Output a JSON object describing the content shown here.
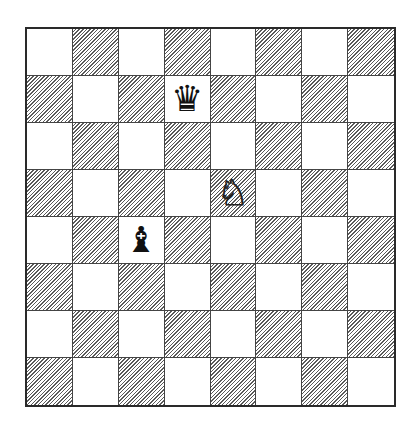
{
  "board": {
    "size": 8,
    "light_color": "#ffffff",
    "dark_pattern": "diagonal-hatch",
    "pieces": [
      {
        "row": 1,
        "col": 3,
        "type": "queen",
        "color": "black",
        "glyph": "♛"
      },
      {
        "row": 3,
        "col": 4,
        "type": "knight",
        "color": "white",
        "glyph": "♘"
      },
      {
        "row": 4,
        "col": 2,
        "type": "bishop",
        "color": "black",
        "glyph": "♝"
      }
    ]
  }
}
